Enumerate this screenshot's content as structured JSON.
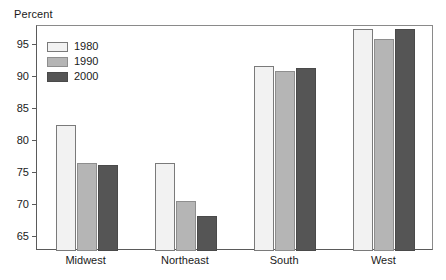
{
  "chart_data": {
    "type": "bar",
    "title": "",
    "subtitle": "",
    "xlabel": "",
    "ylabel": "Percent",
    "categories": [
      "Midwest",
      "Northeast",
      "South",
      "West"
    ],
    "series": [
      {
        "name": "1980",
        "color": "#f2f2f2",
        "values": [
          82.5,
          76.6,
          91.8,
          97.5
        ]
      },
      {
        "name": "1990",
        "color": "#b5b5b5",
        "values": [
          76.6,
          70.7,
          90.9,
          96.0
        ]
      },
      {
        "name": "2000",
        "color": "#555555",
        "values": [
          76.2,
          68.2,
          91.5,
          97.6
        ]
      }
    ],
    "ylim": [
      62.8,
      98.0
    ],
    "yticks": [
      65,
      70,
      75,
      80,
      85,
      90,
      95
    ],
    "ytick_labels": [
      "65",
      "70",
      "75",
      "80",
      "85",
      "90",
      "95"
    ],
    "grid": false,
    "legend_position": "top-left",
    "legend_entries": [
      "1980",
      "1990",
      "2000"
    ],
    "annotations": []
  },
  "axis": {
    "y_title": "Percent"
  }
}
